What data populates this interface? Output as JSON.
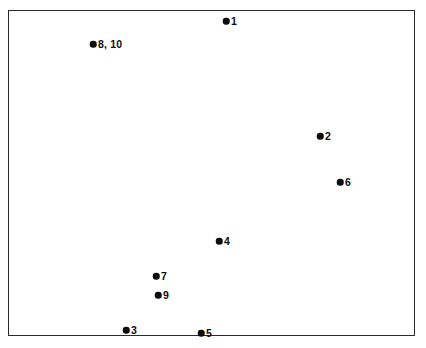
{
  "figure": {
    "background_color": "#ffffff",
    "frame_color": "#2b2b2b",
    "marker_color": "#0d0d0d",
    "label_color": "#0d0d0d"
  },
  "chart_data": {
    "type": "scatter",
    "title": "",
    "subtitle": "",
    "xlabel": "",
    "ylabel": "",
    "xlim": [
      0,
      100
    ],
    "ylim": [
      0,
      100
    ],
    "grid": false,
    "legend": null,
    "axis_ticks": false,
    "axis_tick_labels": [],
    "note": "Unlabeled configuration plot: nine plotted markers representing ten objects; objects 8 and 10 coincide at a single point.",
    "points": [
      {
        "label": "1",
        "px": 226,
        "py": 21,
        "x": 53.6,
        "y": 96.6
      },
      {
        "label": "8, 10",
        "px": 93,
        "py": 44,
        "x": 20.9,
        "y": 89.6
      },
      {
        "label": "2",
        "px": 320,
        "py": 136,
        "x": 76.7,
        "y": 61.3
      },
      {
        "label": "6",
        "px": 340,
        "py": 182,
        "x": 81.6,
        "y": 47.2
      },
      {
        "label": "4",
        "px": 219,
        "py": 241,
        "x": 51.8,
        "y": 29.1
      },
      {
        "label": "7",
        "px": 156,
        "py": 276,
        "x": 36.4,
        "y": 18.4
      },
      {
        "label": "9",
        "px": 158,
        "py": 295,
        "x": 36.9,
        "y": 12.6
      },
      {
        "label": "3",
        "px": 126,
        "py": 330,
        "x": 29.0,
        "y": 1.8
      },
      {
        "label": "5",
        "px": 201,
        "py": 333,
        "x": 47.4,
        "y": 0.9
      }
    ]
  }
}
